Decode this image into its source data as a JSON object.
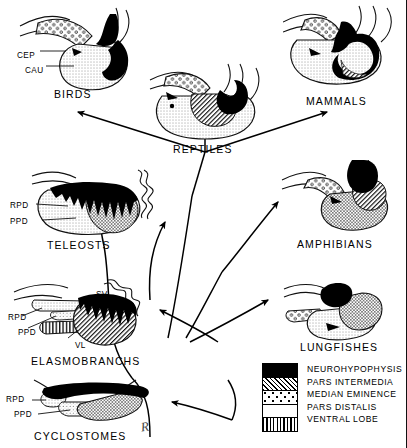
{
  "diagram": {
    "signature": "R"
  },
  "taxa": [
    {
      "id": "birds",
      "caption": "BIRDS"
    },
    {
      "id": "reptiles",
      "caption": "REPTILES"
    },
    {
      "id": "mammals",
      "caption": "MAMMALS"
    },
    {
      "id": "teleosts",
      "caption": "TELEOSTS"
    },
    {
      "id": "amphibians",
      "caption": "AMPHIBIANS"
    },
    {
      "id": "elasmobranchs",
      "caption": "ELASMOBRANCHS"
    },
    {
      "id": "lungfishes",
      "caption": "LUNGFISHES"
    },
    {
      "id": "cyclostomes",
      "caption": "CYCLOSTOMES"
    }
  ],
  "annotations": {
    "birds": [
      {
        "text": "CEP"
      },
      {
        "text": "CAU"
      }
    ],
    "teleosts": [
      {
        "text": "RPD"
      },
      {
        "text": "PPD"
      }
    ],
    "elasmobranchs": [
      {
        "text": "SV"
      },
      {
        "text": "RPD"
      },
      {
        "text": "PPD"
      },
      {
        "text": "VL"
      }
    ],
    "cyclostomes": [
      {
        "text": "RPD"
      },
      {
        "text": "PPD"
      }
    ]
  },
  "legend": {
    "items": [
      {
        "label": "NEUROHYPOPHYSIS",
        "pattern": "solid-black",
        "color": "#000000"
      },
      {
        "label": "PARS  INTERMEDIA",
        "pattern": "diagonal-hatch",
        "color": "#000000"
      },
      {
        "label": "MEDIAN EMINENCE",
        "pattern": "open-circles",
        "color": "#000000"
      },
      {
        "label": "PARS  DISTALIS",
        "pattern": "fine-stipple",
        "color": "#333333"
      },
      {
        "label": "VENTRAL  LOBE",
        "pattern": "vertical-lines",
        "color": "#000000"
      }
    ]
  },
  "tree": {
    "description": "Phylogenetic arrows radiating from a common stem",
    "arrows": [
      {
        "from": "stem",
        "to": "birds"
      },
      {
        "from": "stem",
        "to": "reptiles"
      },
      {
        "from": "stem",
        "to": "mammals"
      },
      {
        "from": "stem",
        "to": "amphibians"
      },
      {
        "from": "stem",
        "to": "lungfishes"
      },
      {
        "from": "stem",
        "to": "teleosts"
      },
      {
        "from": "stem",
        "to": "elasmobranchs"
      },
      {
        "from": "stem",
        "to": "cyclostomes"
      }
    ]
  }
}
